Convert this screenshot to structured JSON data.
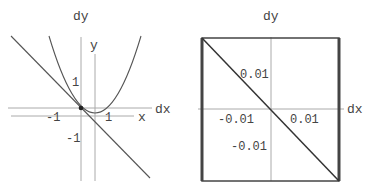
{
  "left_panel": {
    "dy_label": "dy",
    "dx_label": "dx",
    "y_label": "y",
    "x_label": "x",
    "tick_1_y": "1",
    "tick_neg1_y": "-1",
    "tick_neg1_x": "-1",
    "tick_1_x": "1",
    "description": "Parabola y = x^2 with tangent line at x = -1/2 (slope -1); local dx-dy axes centered at tangency point"
  },
  "right_panel": {
    "dy_label": "dy",
    "dx_label": "dx",
    "tick_pos_y": "0.01",
    "tick_neg_y": "-0.01",
    "tick_neg_x": "-0.01",
    "tick_pos_x": "0.01",
    "description": "Zoomed view: tangent line dy = -dx in a framed box"
  },
  "colors": {
    "axis": "#999999",
    "curve": "#555555",
    "frame": "#444444"
  }
}
